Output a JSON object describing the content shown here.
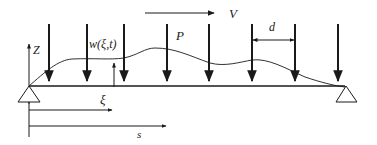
{
  "diagram": {
    "labels": {
      "velocity": "V",
      "load": "P",
      "spacing": "d",
      "vertical_axis": "Z",
      "deflection": "w(ξ,t)",
      "local_coordinate": "ξ",
      "position": "s"
    },
    "colors": {
      "stroke": "#1a1a1a",
      "background": "#ffffff"
    },
    "load_arrow_x": [
      49,
      87,
      124,
      167,
      209,
      252,
      295,
      338
    ],
    "beam": {
      "x_start": 29,
      "x_end": 345,
      "y": 86
    },
    "supports": [
      "pin-left",
      "roller-right"
    ]
  }
}
